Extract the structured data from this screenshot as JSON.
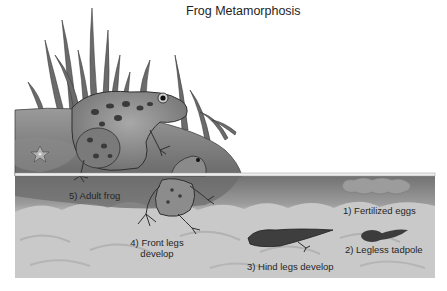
{
  "title": "Frog Metamorphosis",
  "colors": {
    "background": "#ffffff",
    "water_surface": "#e6e6e6",
    "shallow_water": "#8a8a8a",
    "deep_water": "#c7c7c7",
    "rock": "#7d7d7d",
    "grass": "#6e6e6e",
    "frog_skin": "#8c8c8c",
    "frog_spots": "#3a3a3a",
    "tadpole": "#3c3c3c",
    "eggs": "#9a9a9a"
  },
  "stages": [
    {
      "number": 1,
      "label": "1) Fertilized eggs"
    },
    {
      "number": 2,
      "label": "2) Legless tadpole"
    },
    {
      "number": 3,
      "label": "3) Hind legs develop"
    },
    {
      "number": 4,
      "label_line1": "4) Front legs",
      "label_line2": "develop"
    },
    {
      "number": 5,
      "label": "5) Adult frog"
    }
  ]
}
